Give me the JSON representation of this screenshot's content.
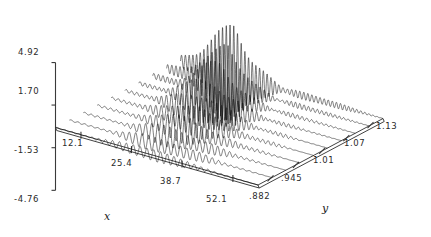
{
  "chart_data": {
    "type": "line",
    "title": "",
    "subtitle": "",
    "projection": "3d-waterfall",
    "xlabel": "x",
    "ylabel": "y",
    "zlabel": "",
    "xticks": [
      "12.1",
      "25.4",
      "38.7",
      "52.1"
    ],
    "xtick_values": [
      12.1,
      25.4,
      38.7,
      52.1
    ],
    "yticks": [
      ".882",
      ".945",
      "1.01",
      "1.07",
      "1.13"
    ],
    "ytick_values": [
      0.882,
      0.945,
      1.01,
      1.07,
      1.13
    ],
    "zticks": [
      "4.92",
      "1.70",
      "-1.53",
      "-4.76"
    ],
    "ztick_values": [
      4.92,
      1.7,
      -1.53,
      -4.76
    ],
    "zlim": [
      -4.76,
      4.92
    ],
    "xlim": [
      5.4,
      58.7
    ],
    "ylim": [
      0.851,
      1.161
    ],
    "grid": false,
    "legend": false,
    "n_traces": 10,
    "series": [
      {
        "name": "y=1.13",
        "amplitude": 5.1,
        "freq": 54,
        "peak_x": 0.27,
        "width": 0.22,
        "decay": 2.6
      },
      {
        "name": "y=1.10",
        "amplitude": 3.4,
        "freq": 50,
        "peak_x": 0.3,
        "width": 0.24,
        "decay": 2.4
      },
      {
        "name": "y=1.07",
        "amplitude": 2.5,
        "freq": 46,
        "peak_x": 0.34,
        "width": 0.26,
        "decay": 2.2
      },
      {
        "name": "y=1.04",
        "amplitude": 1.95,
        "freq": 43,
        "peak_x": 0.38,
        "width": 0.28,
        "decay": 2.0
      },
      {
        "name": "y=1.01",
        "amplitude": 1.6,
        "freq": 40,
        "peak_x": 0.41,
        "width": 0.3,
        "decay": 1.9
      },
      {
        "name": "y=.978",
        "amplitude": 1.35,
        "freq": 37,
        "peak_x": 0.44,
        "width": 0.32,
        "decay": 1.8
      },
      {
        "name": "y=.945",
        "amplitude": 1.12,
        "freq": 35,
        "peak_x": 0.46,
        "width": 0.33,
        "decay": 1.7
      },
      {
        "name": "y=.913",
        "amplitude": 0.92,
        "freq": 33,
        "peak_x": 0.48,
        "width": 0.34,
        "decay": 1.6
      },
      {
        "name": "y=.897",
        "amplitude": 0.72,
        "freq": 31,
        "peak_x": 0.49,
        "width": 0.35,
        "decay": 1.55
      },
      {
        "name": "y=.882",
        "amplitude": 0.55,
        "freq": 29,
        "peak_x": 0.5,
        "width": 0.36,
        "decay": 1.5
      }
    ],
    "colors": {
      "line": "#111111",
      "axis": "#3a3a3a",
      "background": "#ffffff"
    }
  },
  "axes": {
    "z": {
      "ticks": [
        {
          "label": "4.92",
          "x": 18,
          "y": 48
        },
        {
          "label": "1.70",
          "x": 18,
          "y": 87
        },
        {
          "label": "-1.53",
          "x": 14,
          "y": 146
        },
        {
          "label": "-4.76",
          "x": 14,
          "y": 195
        }
      ]
    },
    "x": {
      "title": "x",
      "title_pos": {
        "x": 104,
        "y": 211
      },
      "ticks": [
        {
          "label": "12.1",
          "x": 62,
          "y": 139
        },
        {
          "label": "25.4",
          "x": 111,
          "y": 159
        },
        {
          "label": "38.7",
          "x": 160,
          "y": 177
        },
        {
          "label": "52.1",
          "x": 206,
          "y": 195
        }
      ]
    },
    "y": {
      "title": "y",
      "title_pos": {
        "x": 322,
        "y": 203
      },
      "ticks": [
        {
          "label": ".882",
          "x": 249,
          "y": 192
        },
        {
          "label": ".945",
          "x": 281,
          "y": 174
        },
        {
          "label": "1.01",
          "x": 313,
          "y": 156
        },
        {
          "label": "1.07",
          "x": 344,
          "y": 139
        },
        {
          "label": "1.13",
          "x": 376,
          "y": 122
        }
      ]
    }
  }
}
